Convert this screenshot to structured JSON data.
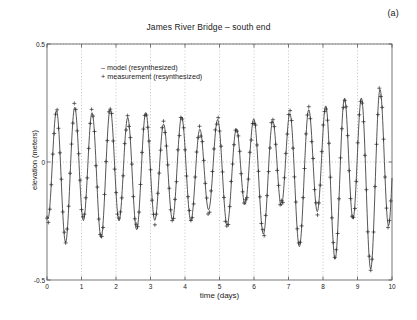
{
  "figure": {
    "panel_label": "(a)",
    "title": "James River Bridge – south end"
  },
  "legend": {
    "model": "–  model (resynthesized)",
    "measurement": "+  measurement (resynthesized)"
  },
  "colors": {
    "line": "#2b2b2b",
    "marker": "#2b2b2b",
    "axis": "#555555",
    "grid": "#999999",
    "background": "#ffffff"
  },
  "chart_data": {
    "type": "line",
    "title": "James River Bridge – south end",
    "xlabel": "time (days)",
    "ylabel": "elevation (meters)",
    "xlim": [
      0,
      10
    ],
    "ylim": [
      -0.5,
      0.5
    ],
    "xticks": [
      0,
      1,
      2,
      3,
      4,
      5,
      6,
      7,
      8,
      9,
      10
    ],
    "xticklabels": [
      "0",
      "1",
      "2",
      "3",
      "4",
      "5",
      "6",
      "7",
      "8",
      "9",
      "10"
    ],
    "yticks": [
      -0.5,
      0,
      0.5
    ],
    "yticklabels": [
      "-0.5",
      "0",
      "0.5"
    ],
    "grid": "vertical dotted at integer days; horizontal dotted at -0.5, 0, 0.5",
    "legend_position": "upper-left inside axes",
    "marker": "+",
    "sample_interval_days": 0.0417,
    "series": [
      {
        "name": "model (resynthesized)",
        "style": "solid line",
        "description": "Semidiurnal tide with diurnal inequality; envelope amplitude grows from ~0.28 m at day 0 to ~0.48 m near day 7.5 (spring tide), slight decay after.",
        "harmonics": [
          {
            "component": "M2",
            "period_days": 0.5175,
            "amplitude": 0.26,
            "phase_deg": 150
          },
          {
            "component": "S2",
            "period_days": 0.5,
            "amplitude": 0.085,
            "phase_deg": 200
          },
          {
            "component": "K1",
            "period_days": 0.9973,
            "amplitude": 0.055,
            "phase_deg": 30
          },
          {
            "component": "O1",
            "period_days": 1.0758,
            "amplitude": 0.035,
            "phase_deg": 300
          }
        ]
      },
      {
        "name": "measurement (resynthesized)",
        "style": "plus markers",
        "description": "Discrete + markers following the model curve with small scatter (±0.02 m), denser near extremes."
      }
    ],
    "peaks_approx": {
      "days": [
        0.18,
        0.68,
        1.22,
        1.72,
        2.25,
        2.76,
        3.3,
        3.8,
        4.35,
        4.85,
        5.38,
        5.88,
        6.4,
        6.9,
        7.45,
        7.95,
        8.46,
        8.97,
        9.5
      ],
      "elevations": [
        0.29,
        0.175,
        0.33,
        0.21,
        0.35,
        0.22,
        0.42,
        0.26,
        0.46,
        0.29,
        0.47,
        0.32,
        0.47,
        0.33,
        0.5,
        0.4,
        0.47,
        0.35,
        0.44
      ]
    },
    "troughs_approx": {
      "days": [
        0.43,
        0.95,
        1.47,
        1.99,
        2.52,
        3.03,
        3.55,
        4.07,
        4.6,
        5.12,
        5.64,
        6.15,
        6.67,
        7.2,
        7.72,
        8.23,
        8.74,
        9.25,
        9.76
      ],
      "elevations": [
        -0.22,
        -0.25,
        -0.23,
        -0.26,
        -0.24,
        -0.28,
        -0.26,
        -0.3,
        -0.29,
        -0.33,
        -0.31,
        -0.37,
        -0.34,
        -0.4,
        -0.37,
        -0.41,
        -0.38,
        -0.41,
        -0.38
      ]
    }
  }
}
